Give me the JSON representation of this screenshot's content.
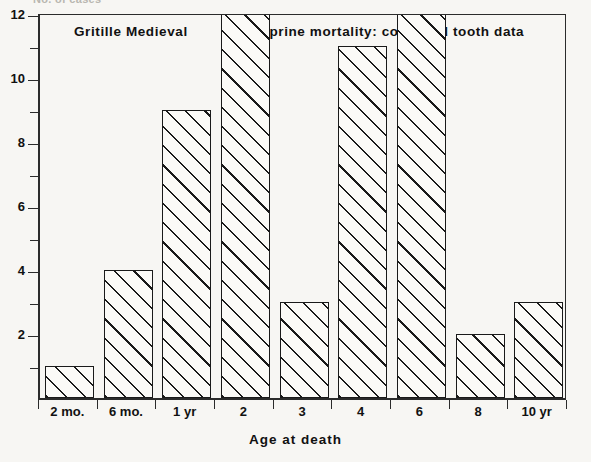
{
  "figure": {
    "y_axis_caption": "No. of cases",
    "x_axis_title": "Age at death",
    "caption_left": "Gritille Medieval",
    "caption_right": "Caprine mortality: corrected tooth data"
  },
  "chart_data": {
    "type": "bar",
    "title": "Caprine mortality: corrected tooth data",
    "subtitle": "Gritille Medieval",
    "xlabel": "Age at death",
    "ylabel": "No. of cases",
    "categories": [
      "2 mo.",
      "6 mo.",
      "1 yr",
      "2",
      "3",
      "4",
      "6",
      "8",
      "10 yr"
    ],
    "values": [
      1,
      4,
      9,
      13,
      3,
      11,
      12,
      2,
      3
    ],
    "value_notes": {
      "2": "bar extends beyond top of plot frame (clipped); visible height >= 13"
    },
    "ylim": [
      0,
      12.6
    ],
    "yticks": [
      2,
      4,
      6,
      8,
      10,
      12
    ],
    "yticks_minor": [
      1,
      3,
      5,
      7,
      9,
      11
    ],
    "grid": false,
    "legend": false,
    "bar_fill": "diagonal-hatch",
    "colors": {
      "line": "#1a1a1a",
      "background": "#f7f6f3",
      "bar_fill": "#fbfaf7"
    }
  }
}
